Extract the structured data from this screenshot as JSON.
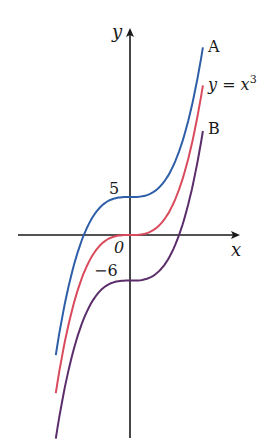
{
  "figure": {
    "type": "graph-of-cubic-translations",
    "axes": {
      "x_label": "x",
      "y_label": "y",
      "origin_label": "0",
      "origin_px": [
        130,
        235
      ],
      "x_px_per_unit": 27,
      "y_px_per_unit": 7.6,
      "x_axis_start_px": 18,
      "x_axis_end_px": 238,
      "y_axis_top_px": 30,
      "y_axis_bottom_px": 438,
      "color": "#1a1a1a"
    },
    "intercept_labels": [
      {
        "text": "5",
        "x": 111,
        "y": 194
      },
      {
        "text": "−6",
        "x": 92,
        "y": 276
      }
    ],
    "curves": [
      {
        "id": "A",
        "label": "A",
        "equation": "y = x³ + 5",
        "shift": 5,
        "color": "#2e5ea8",
        "label_pos": [
          208,
          52
        ]
      },
      {
        "id": "base",
        "label_main": "y = x",
        "label_sup": "3",
        "equation": "y = x³",
        "shift": 0,
        "color": "#d94a5c",
        "label_pos": [
          208,
          89
        ]
      },
      {
        "id": "B",
        "label": "B",
        "equation": "y = x³ − 6",
        "shift": -6,
        "color": "#5b2e6b",
        "label_pos": [
          208,
          134
        ]
      }
    ],
    "x_range": [
      -2.75,
      2.7
    ]
  },
  "chart_data": {
    "type": "line",
    "title": "",
    "xlabel": "x",
    "ylabel": "y",
    "grid": false,
    "legend": "inline labels at curve ends",
    "series": [
      {
        "name": "A",
        "function": "x^3 + 5",
        "y_intercept": 5,
        "x_intercept": -1.71
      },
      {
        "name": "y = x^3",
        "function": "x^3",
        "y_intercept": 0,
        "x_intercept": 0
      },
      {
        "name": "B",
        "function": "x^3 - 6",
        "y_intercept": -6,
        "x_intercept": 1.82
      }
    ],
    "annotations": [
      "5",
      "0",
      "−6",
      "A",
      "y = x³",
      "B"
    ]
  }
}
